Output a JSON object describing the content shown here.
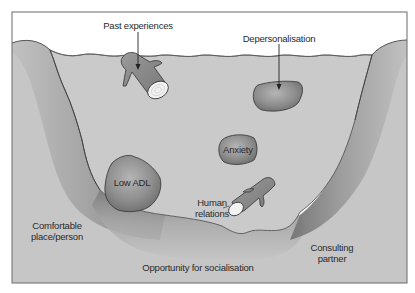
{
  "diagram": {
    "title": "",
    "labels": {
      "past_experiences": "Past experiences",
      "depersonalisation": "Depersonalisation",
      "anxiety": "Anxiety",
      "low_adl": "Low ADL",
      "human_relations_line1": "Human",
      "human_relations_line2": "relations",
      "comfortable_line1": "Comfortable",
      "comfortable_line2": "place/person",
      "opportunity": "Opportunity for socialisation",
      "consulting_line1": "Consulting",
      "consulting_line2": "partner"
    },
    "elements": {
      "water": "river/riverbed cross-section",
      "obstacles": [
        "log (Past experiences)",
        "rock (Depersonalisation)",
        "rock (Anxiety)",
        "rock (Low ADL)",
        "log (Human relations)"
      ],
      "banks": [
        "Comfortable place/person",
        "Opportunity for socialisation",
        "Consulting partner"
      ]
    },
    "colors": {
      "frame": "#6b6b6b",
      "sky": "#ffffff",
      "water": "#c9c9c9",
      "bank_light": "#c4c4c4",
      "bank_dark": "#7a7a7a",
      "rock": "#8a8a8a",
      "log": "#8c8c8c",
      "log_end": "#f2f2f2",
      "text": "#2a2a2a"
    }
  }
}
